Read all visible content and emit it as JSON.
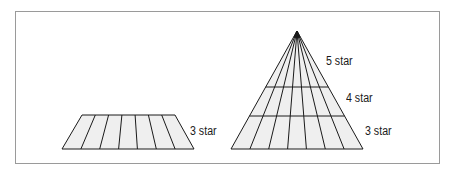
{
  "diagram": {
    "colors": {
      "fill": "#efefef",
      "stroke": "#1a1a1a",
      "frame": "#9a9a9a"
    },
    "left_shape": {
      "type": "trapezoid",
      "sections": 7,
      "label": "3 star"
    },
    "right_shape": {
      "type": "pyramid",
      "sections": 7,
      "tiers": [
        {
          "label": "5 star"
        },
        {
          "label": "4 star"
        },
        {
          "label": "3 star"
        }
      ]
    }
  }
}
